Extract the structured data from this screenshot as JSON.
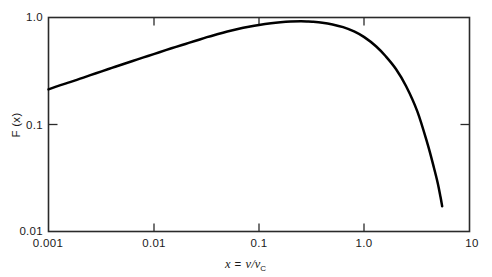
{
  "chart_data": {
    "type": "line",
    "title": "",
    "subtitle": "",
    "xlabel": "x = ν/ν_C",
    "ylabel": "F (x)",
    "xscale": "log",
    "yscale": "log",
    "xlim": [
      0.001,
      10
    ],
    "ylim": [
      0.01,
      1.0
    ],
    "grid": false,
    "legend": null,
    "x_tick_labels": [
      "0.001",
      "0.01",
      "0.1",
      "1.0",
      "10"
    ],
    "x_tick_values": [
      0.001,
      0.01,
      0.1,
      1.0,
      10
    ],
    "y_tick_labels": [
      "1.0",
      "0.1",
      "0.01"
    ],
    "y_tick_values": [
      1.0,
      0.1,
      0.01
    ],
    "series": [
      {
        "name": "F(x)",
        "color": "#000000",
        "x": [
          0.001,
          0.0013,
          0.0016,
          0.002,
          0.0025,
          0.0032,
          0.004,
          0.005,
          0.0063,
          0.008,
          0.01,
          0.013,
          0.016,
          0.02,
          0.025,
          0.032,
          0.04,
          0.05,
          0.063,
          0.08,
          0.1,
          0.13,
          0.16,
          0.2,
          0.25,
          0.29,
          0.32,
          0.4,
          0.5,
          0.63,
          0.8,
          1.0,
          1.3,
          1.6,
          2.0,
          2.5,
          3.2,
          4.0,
          4.6,
          5.0,
          5.3,
          5.5
        ],
        "y": [
          0.213,
          0.233,
          0.249,
          0.268,
          0.289,
          0.314,
          0.338,
          0.364,
          0.392,
          0.424,
          0.455,
          0.495,
          0.529,
          0.566,
          0.606,
          0.655,
          0.697,
          0.739,
          0.78,
          0.819,
          0.852,
          0.884,
          0.903,
          0.916,
          0.921,
          0.918,
          0.913,
          0.894,
          0.861,
          0.812,
          0.74,
          0.655,
          0.536,
          0.434,
          0.33,
          0.228,
          0.132,
          0.0655,
          0.0392,
          0.0281,
          0.0211,
          0.0172
        ]
      }
    ],
    "annotations": {
      "peak_x": 0.29,
      "peak_y": 0.92,
      "curve_end_x": 5.5,
      "left_edge_y": 0.213
    }
  },
  "axis": {
    "x_label_prefix": "x",
    "x_label_equals": "=",
    "x_label_numerator": "ν",
    "x_label_slash": "/",
    "x_label_denominator": "ν",
    "x_label_subscript": "C",
    "y_label": "F (x)"
  },
  "ticks": {
    "x": [
      {
        "label": "0.001",
        "value": 0.001
      },
      {
        "label": "0.01",
        "value": 0.01
      },
      {
        "label": "0.1",
        "value": 0.1
      },
      {
        "label": "1.0",
        "value": 1.0
      },
      {
        "label": "10",
        "value": 10
      }
    ],
    "y": [
      {
        "label": "1.0",
        "value": 1.0
      },
      {
        "label": "0.1",
        "value": 0.1
      },
      {
        "label": "0.01",
        "value": 0.01
      }
    ]
  },
  "colors": {
    "curve": "#000000",
    "frame": "#2a2a2a",
    "background": "#ffffff",
    "text": "#1a1a1a"
  }
}
